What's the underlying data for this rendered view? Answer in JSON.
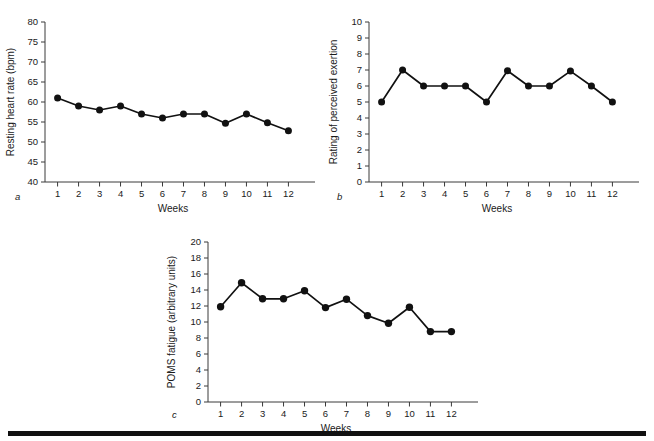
{
  "figure": {
    "panels": [
      {
        "key": "a",
        "panel_label": "a",
        "chart_data": {
          "type": "line",
          "title": "",
          "xlabel": "Weeks",
          "ylabel": "Resting heart rate (bpm)",
          "categories": [
            "1",
            "2",
            "3",
            "4",
            "5",
            "6",
            "7",
            "8",
            "9",
            "10",
            "11",
            "12"
          ],
          "x": [
            1,
            2,
            3,
            4,
            5,
            6,
            7,
            8,
            9,
            10,
            11,
            12
          ],
          "values": [
            61,
            59,
            58,
            59,
            57,
            56,
            57,
            57,
            54.7,
            57,
            54.8,
            52.8
          ],
          "xlim": [
            0.4,
            12.6
          ],
          "ylim": [
            40,
            80
          ],
          "yticks": [
            40,
            45,
            50,
            55,
            60,
            65,
            70,
            75,
            80
          ],
          "ytick_labels": [
            "40",
            "45",
            "50",
            "55",
            "60",
            "65",
            "70",
            "75",
            "80"
          ],
          "xtick_labels": [
            "1",
            "2",
            "3",
            "4",
            "5",
            "6",
            "7",
            "8",
            "9",
            "10",
            "11",
            "12"
          ],
          "grid": false,
          "legend": "none",
          "marker": "filled-circle"
        }
      },
      {
        "key": "b",
        "panel_label": "b",
        "chart_data": {
          "type": "line",
          "title": "",
          "xlabel": "Weeks",
          "ylabel": "Rating of perceived exertion",
          "categories": [
            "1",
            "2",
            "3",
            "4",
            "5",
            "6",
            "7",
            "8",
            "9",
            "10",
            "11",
            "12"
          ],
          "x": [
            1,
            2,
            3,
            4,
            5,
            6,
            7,
            8,
            9,
            10,
            11,
            12
          ],
          "values": [
            5,
            7,
            6,
            6,
            6,
            5,
            6.95,
            6,
            6,
            6.93,
            6,
            5
          ],
          "xlim": [
            0.4,
            12.6
          ],
          "ylim": [
            0,
            10
          ],
          "yticks": [
            0,
            1,
            2,
            3,
            4,
            5,
            6,
            7,
            8,
            9,
            10
          ],
          "ytick_labels": [
            "0",
            "1",
            "2",
            "3",
            "4",
            "5",
            "6",
            "7",
            "8",
            "9",
            "10"
          ],
          "xtick_labels": [
            "1",
            "2",
            "3",
            "4",
            "5",
            "6",
            "7",
            "8",
            "9",
            "10",
            "11",
            "12"
          ],
          "grid": false,
          "legend": "none",
          "marker": "filled-circle"
        }
      },
      {
        "key": "c",
        "panel_label": "c",
        "chart_data": {
          "type": "line",
          "title": "",
          "xlabel": "Weeks",
          "ylabel": "POMS fatigue (arbitrary units)",
          "categories": [
            "1",
            "2",
            "3",
            "4",
            "5",
            "6",
            "7",
            "8",
            "9",
            "10",
            "11",
            "12"
          ],
          "x": [
            1,
            2,
            3,
            4,
            5,
            6,
            7,
            8,
            9,
            10,
            11,
            12
          ],
          "values": [
            11.9,
            14.9,
            12.9,
            12.9,
            13.9,
            11.8,
            12.85,
            10.8,
            9.85,
            11.85,
            8.8,
            8.8
          ],
          "xlim": [
            0.4,
            12.6
          ],
          "ylim": [
            0,
            20
          ],
          "yticks": [
            0,
            2,
            4,
            6,
            8,
            10,
            12,
            14,
            16,
            18,
            20
          ],
          "ytick_labels": [
            "0",
            "2",
            "4",
            "6",
            "8",
            "10",
            "12",
            "14",
            "16",
            "18",
            "20"
          ],
          "xtick_labels": [
            "1",
            "2",
            "3",
            "4",
            "5",
            "6",
            "7",
            "8",
            "9",
            "10",
            "11",
            "12"
          ],
          "grid": false,
          "legend": "none",
          "marker": "filled-circle"
        }
      }
    ],
    "colors": {
      "series": "#111111",
      "axis": "#3a3a3a",
      "text": "#1a1a1a",
      "rule": "#111111",
      "background": "#ffffff"
    }
  }
}
